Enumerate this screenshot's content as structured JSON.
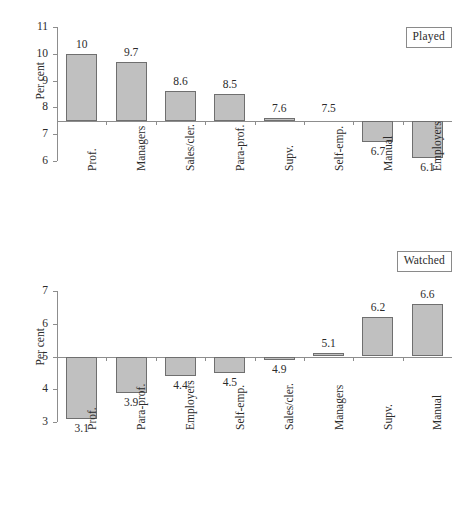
{
  "chart_data": [
    {
      "type": "bar",
      "title": "Played",
      "xlabel": "",
      "ylabel": "Per cent",
      "ylim": [
        6,
        11
      ],
      "yticks": [
        6,
        7,
        8,
        9,
        10,
        11
      ],
      "baseline": 7.5,
      "grid": false,
      "legend_position": "top-right",
      "categories": [
        "Prof.",
        "Managers",
        "Sales/cler.",
        "Para-prof.",
        "Supv.",
        "Self-emp.",
        "Manual",
        "Employers"
      ],
      "values": [
        10,
        9.7,
        8.6,
        8.5,
        7.6,
        7.5,
        6.7,
        6.1
      ],
      "value_labels": [
        "10",
        "9.7",
        "8.6",
        "8.5",
        "7.6",
        "7.5",
        "6.7",
        "6.1"
      ]
    },
    {
      "type": "bar",
      "title": "Watched",
      "xlabel": "",
      "ylabel": "Per cent",
      "ylim": [
        3,
        7
      ],
      "yticks": [
        3,
        4,
        5,
        6,
        7
      ],
      "baseline": 5,
      "grid": false,
      "legend_position": "top-right",
      "categories": [
        "Prof.",
        "Para-prof.",
        "Employers",
        "Self-emp.",
        "Sales/cler.",
        "Managers",
        "Supv.",
        "Manual"
      ],
      "values": [
        3.1,
        3.9,
        4.4,
        4.5,
        4.9,
        5.1,
        6.2,
        6.6
      ],
      "value_labels": [
        "3.1",
        "3.9",
        "4.4",
        "4.5",
        "4.9",
        "5.1",
        "6.2",
        "6.6"
      ]
    }
  ],
  "panels": {
    "played": {
      "badge": "Played",
      "ylabel": "Per cent",
      "yticks": [
        "11",
        "10",
        "9",
        "8",
        "7",
        "6"
      ],
      "categories": [
        "Prof.",
        "Managers",
        "Sales/cler.",
        "Para-prof.",
        "Supv.",
        "Self-emp.",
        "Manual",
        "Employers"
      ],
      "value_labels": [
        "10",
        "9.7",
        "8.6",
        "8.5",
        "7.6",
        "7.5",
        "6.7",
        "6.1"
      ]
    },
    "watched": {
      "badge": "Watched",
      "ylabel": "Per cent",
      "yticks": [
        "7",
        "6",
        "5",
        "4",
        "3"
      ],
      "categories": [
        "Prof.",
        "Para-prof.",
        "Employers",
        "Self-emp.",
        "Sales/cler.",
        "Managers",
        "Supv.",
        "Manual"
      ],
      "value_labels": [
        "3.1",
        "3.9",
        "4.4",
        "4.5",
        "4.9",
        "5.1",
        "6.2",
        "6.6"
      ]
    }
  },
  "colors": {
    "bar_fill": "#c0c0c0",
    "bar_stroke": "#6f6f6f",
    "axis": "#8d8d8d",
    "text": "#2b2b2b",
    "background": "#ffffff"
  }
}
